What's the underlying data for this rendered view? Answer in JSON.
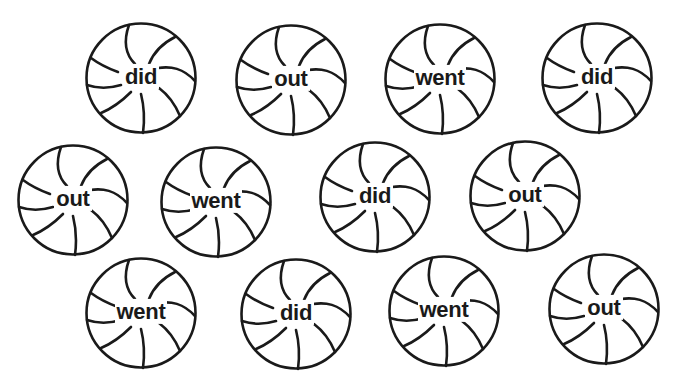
{
  "worksheet": {
    "style": {
      "ink": "#1a1a1a",
      "paper": "#ffffff"
    },
    "candies": [
      {
        "word": "did",
        "cx": 141,
        "cy": 78
      },
      {
        "word": "out",
        "cx": 291,
        "cy": 80
      },
      {
        "word": "went",
        "cx": 440,
        "cy": 79
      },
      {
        "word": "did",
        "cx": 597,
        "cy": 78
      },
      {
        "word": "out",
        "cx": 73,
        "cy": 200
      },
      {
        "word": "went",
        "cx": 216,
        "cy": 202
      },
      {
        "word": "did",
        "cx": 375,
        "cy": 197
      },
      {
        "word": "out",
        "cx": 525,
        "cy": 196
      },
      {
        "word": "went",
        "cx": 141,
        "cy": 313
      },
      {
        "word": "did",
        "cx": 296,
        "cy": 314
      },
      {
        "word": "went",
        "cx": 444,
        "cy": 311
      },
      {
        "word": "out",
        "cx": 604,
        "cy": 309
      }
    ]
  }
}
